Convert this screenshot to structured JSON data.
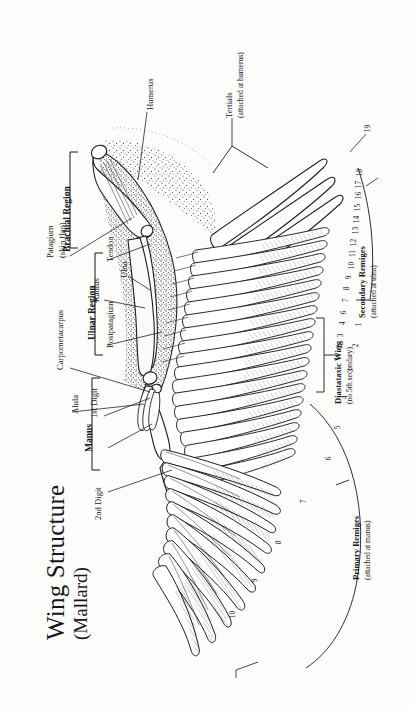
{
  "plate": {
    "title": "Wing Structure",
    "subtitle": "(Mallard)",
    "species": "Mallard",
    "view": "dorsal view of spread left wing",
    "medium": "pen-and-ink stipple and line illustration"
  },
  "skeletal_labels": [
    {
      "id": "humerus",
      "text": "Humerus",
      "weight": "normal"
    },
    {
      "id": "radius",
      "text": "Radius",
      "weight": "normal"
    },
    {
      "id": "ulna",
      "text": "Ulna",
      "weight": "normal"
    },
    {
      "id": "tendon",
      "text": "Tendon",
      "weight": "normal"
    },
    {
      "id": "carpometacarpus",
      "text": "Carpometacarpus",
      "weight": "normal"
    },
    {
      "id": "alula",
      "text": "Alula",
      "weight": "normal"
    },
    {
      "id": "first-digit",
      "text": "1st Digit",
      "weight": "normal"
    },
    {
      "id": "second-digit",
      "text": "2nd Digit",
      "weight": "normal"
    }
  ],
  "membrane_labels": [
    {
      "id": "patagium",
      "line1": "Patagium",
      "line2": "(skin flap)"
    },
    {
      "id": "postpatagium",
      "line1": "Postpatagium",
      "line2": ""
    }
  ],
  "region_labels": [
    {
      "id": "brachial-region",
      "text": "Brachial Region"
    },
    {
      "id": "ulnar-region",
      "text": "Ulnar Region"
    },
    {
      "id": "manus",
      "text": "Manus"
    }
  ],
  "feather_groups": [
    {
      "id": "tertials",
      "line1": "Tertials",
      "line2": "(attached at humerus)",
      "attachment": "humerus",
      "numbers": [
        "19"
      ]
    },
    {
      "id": "secondary-remiges",
      "line1": "Secondary Remiges",
      "line2": "(attached at ulna)",
      "attachment": "ulna",
      "numbers": [
        "1",
        "2",
        "3",
        "4",
        "6",
        "7",
        "8",
        "9",
        "10",
        "11",
        "12",
        "13",
        "14",
        "15",
        "16",
        "17",
        "18"
      ]
    },
    {
      "id": "primary-remiges",
      "line1": "Primary Remiges",
      "line2": "(attached at manus)",
      "attachment": "manus",
      "numbers": [
        "1",
        "2",
        "3",
        "4",
        "5",
        "6",
        "7",
        "8",
        "9",
        "10"
      ]
    }
  ],
  "annotations": [
    {
      "id": "diastataxic-wing",
      "line1": "Diastataxic Wing",
      "line2": "(no 5th secondary)"
    }
  ],
  "colors": {
    "paper": "#fdfdfc",
    "ink": "#17171a",
    "line": "#1d1d20",
    "shade": "#6f6f74",
    "stipple": "#3a3a3e"
  }
}
